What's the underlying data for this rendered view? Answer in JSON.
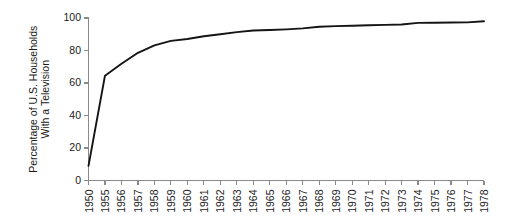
{
  "chart_data": {
    "type": "line",
    "title": "",
    "xlabel": "",
    "ylabel_line1": "Percentage of U.S. Households",
    "ylabel_line2": "With a Television",
    "ylabel": "Percentage of U.S. Households With a Television",
    "grid": false,
    "legend": false,
    "ylim": [
      0,
      100
    ],
    "yticks": [
      0,
      20,
      40,
      60,
      80,
      100
    ],
    "ytick_labels": [
      "0",
      "20",
      "40",
      "60",
      "80",
      "100"
    ],
    "categories": [
      "1950",
      "1955",
      "1956",
      "1957",
      "1958",
      "1959",
      "1960",
      "1961",
      "1962",
      "1963",
      "1964",
      "1965",
      "1966",
      "1967",
      "1968",
      "1969",
      "1970",
      "1971",
      "1972",
      "1973",
      "1974",
      "1975",
      "1976",
      "1977",
      "1978"
    ],
    "values": [
      9,
      64.5,
      71.8,
      78.6,
      83.2,
      85.9,
      87.1,
      88.8,
      90.0,
      91.3,
      92.3,
      92.6,
      93.0,
      93.6,
      94.6,
      95.0,
      95.2,
      95.5,
      95.8,
      96.0,
      97.0,
      97.1,
      97.2,
      97.3,
      98.0
    ]
  }
}
